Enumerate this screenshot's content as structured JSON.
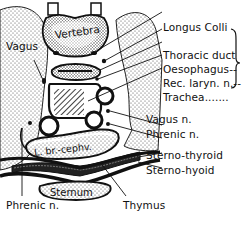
{
  "diagram": {
    "colors": {
      "ink": "#111111",
      "background": "#ffffff",
      "stipple": "#555555"
    },
    "structures": {
      "vertebra": "Vertebra",
      "brachiocephalic_vein": "L. br.-cephv.",
      "sternum": "Sternum"
    },
    "labels": {
      "vagus_left": "Vagus",
      "longus_colli": "Longus Colli",
      "thoracic_duct": "Thoracic duct",
      "oesophagus": "Oesophagus--",
      "rec_laryn": "Rec. laryn. n.--",
      "trachea": "Trachea.......",
      "vagus_n": "Vagus n.",
      "phrenic_n_right": "Phrenic n.",
      "sterno_thyroid": "Sterno-thyroid",
      "sterno_hyoid": "Sterno-hyoid",
      "phrenic_n_bottom": "Phrenic n.",
      "thymus": "Thymus"
    },
    "bracket_group": [
      "Thoracic duct",
      "Oesophagus",
      "Rec. laryn. n.",
      "Trachea"
    ]
  }
}
